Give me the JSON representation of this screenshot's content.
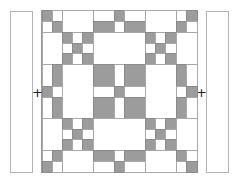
{
  "diagram": {
    "type": "quilt-layout",
    "colors": {
      "fabric_dark": "#9c9c9c",
      "fabric_light": "#ffffff",
      "seam": "#a8a8a8"
    },
    "joiners": [
      {
        "id": "left",
        "symbol": "+",
        "x": 32,
        "y": 86
      },
      {
        "id": "right",
        "symbol": "+",
        "x": 196,
        "y": 86
      }
    ],
    "side_borders": [
      {
        "id": "left-border",
        "x": 10,
        "y": 11,
        "w": 23,
        "h": 162
      },
      {
        "id": "right-border",
        "x": 206,
        "y": 11,
        "w": 23,
        "h": 162
      }
    ],
    "cells": [
      {
        "x": 42,
        "y": 10,
        "w": 10,
        "h": 11,
        "c": "grey"
      },
      {
        "x": 52,
        "y": 10,
        "w": 10,
        "h": 11,
        "c": "white"
      },
      {
        "x": 42,
        "y": 21,
        "w": 10,
        "h": 11,
        "c": "white"
      },
      {
        "x": 52,
        "y": 21,
        "w": 10,
        "h": 11,
        "c": "grey"
      },
      {
        "x": 62,
        "y": 10,
        "w": 31,
        "h": 22,
        "c": "white"
      },
      {
        "x": 93,
        "y": 10,
        "w": 21,
        "h": 11,
        "c": "white"
      },
      {
        "x": 114,
        "y": 10,
        "w": 10,
        "h": 11,
        "c": "grey"
      },
      {
        "x": 124,
        "y": 10,
        "w": 21,
        "h": 11,
        "c": "white"
      },
      {
        "x": 93,
        "y": 21,
        "w": 21,
        "h": 11,
        "c": "grey"
      },
      {
        "x": 114,
        "y": 21,
        "w": 10,
        "h": 11,
        "c": "white"
      },
      {
        "x": 124,
        "y": 21,
        "w": 21,
        "h": 11,
        "c": "grey"
      },
      {
        "x": 145,
        "y": 10,
        "w": 31,
        "h": 22,
        "c": "white"
      },
      {
        "x": 176,
        "y": 10,
        "w": 10,
        "h": 11,
        "c": "white"
      },
      {
        "x": 186,
        "y": 10,
        "w": 11,
        "h": 11,
        "c": "grey"
      },
      {
        "x": 176,
        "y": 21,
        "w": 10,
        "h": 11,
        "c": "grey"
      },
      {
        "x": 186,
        "y": 21,
        "w": 11,
        "h": 11,
        "c": "white"
      },
      {
        "x": 42,
        "y": 32,
        "w": 20,
        "h": 32,
        "c": "white"
      },
      {
        "x": 62,
        "y": 32,
        "w": 10,
        "h": 11,
        "c": "grey"
      },
      {
        "x": 72,
        "y": 32,
        "w": 10,
        "h": 11,
        "c": "white"
      },
      {
        "x": 82,
        "y": 32,
        "w": 11,
        "h": 11,
        "c": "grey"
      },
      {
        "x": 62,
        "y": 43,
        "w": 10,
        "h": 10,
        "c": "white"
      },
      {
        "x": 72,
        "y": 43,
        "w": 10,
        "h": 10,
        "c": "grey"
      },
      {
        "x": 82,
        "y": 43,
        "w": 11,
        "h": 10,
        "c": "white"
      },
      {
        "x": 62,
        "y": 53,
        "w": 10,
        "h": 11,
        "c": "grey"
      },
      {
        "x": 72,
        "y": 53,
        "w": 10,
        "h": 11,
        "c": "white"
      },
      {
        "x": 82,
        "y": 53,
        "w": 11,
        "h": 11,
        "c": "grey"
      },
      {
        "x": 93,
        "y": 32,
        "w": 52,
        "h": 32,
        "c": "white"
      },
      {
        "x": 145,
        "y": 32,
        "w": 10,
        "h": 11,
        "c": "grey"
      },
      {
        "x": 155,
        "y": 32,
        "w": 10,
        "h": 11,
        "c": "white"
      },
      {
        "x": 165,
        "y": 32,
        "w": 11,
        "h": 11,
        "c": "grey"
      },
      {
        "x": 145,
        "y": 43,
        "w": 10,
        "h": 10,
        "c": "white"
      },
      {
        "x": 155,
        "y": 43,
        "w": 10,
        "h": 10,
        "c": "grey"
      },
      {
        "x": 165,
        "y": 43,
        "w": 11,
        "h": 10,
        "c": "white"
      },
      {
        "x": 145,
        "y": 53,
        "w": 10,
        "h": 11,
        "c": "grey"
      },
      {
        "x": 155,
        "y": 53,
        "w": 10,
        "h": 11,
        "c": "white"
      },
      {
        "x": 165,
        "y": 53,
        "w": 11,
        "h": 11,
        "c": "grey"
      },
      {
        "x": 176,
        "y": 32,
        "w": 21,
        "h": 32,
        "c": "white"
      },
      {
        "x": 42,
        "y": 64,
        "w": 10,
        "h": 22,
        "c": "white"
      },
      {
        "x": 52,
        "y": 64,
        "w": 10,
        "h": 22,
        "c": "grey"
      },
      {
        "x": 42,
        "y": 86,
        "w": 10,
        "h": 11,
        "c": "grey"
      },
      {
        "x": 52,
        "y": 86,
        "w": 10,
        "h": 11,
        "c": "white"
      },
      {
        "x": 42,
        "y": 97,
        "w": 10,
        "h": 21,
        "c": "white"
      },
      {
        "x": 52,
        "y": 97,
        "w": 10,
        "h": 21,
        "c": "grey"
      },
      {
        "x": 62,
        "y": 64,
        "w": 31,
        "h": 54,
        "c": "white"
      },
      {
        "x": 93,
        "y": 64,
        "w": 21,
        "h": 22,
        "c": "grey"
      },
      {
        "x": 114,
        "y": 64,
        "w": 10,
        "h": 22,
        "c": "white"
      },
      {
        "x": 124,
        "y": 64,
        "w": 21,
        "h": 22,
        "c": "grey"
      },
      {
        "x": 93,
        "y": 86,
        "w": 21,
        "h": 11,
        "c": "white"
      },
      {
        "x": 114,
        "y": 86,
        "w": 10,
        "h": 11,
        "c": "grey"
      },
      {
        "x": 124,
        "y": 86,
        "w": 21,
        "h": 11,
        "c": "white"
      },
      {
        "x": 93,
        "y": 97,
        "w": 21,
        "h": 21,
        "c": "grey"
      },
      {
        "x": 114,
        "y": 97,
        "w": 10,
        "h": 21,
        "c": "white"
      },
      {
        "x": 124,
        "y": 97,
        "w": 21,
        "h": 21,
        "c": "grey"
      },
      {
        "x": 145,
        "y": 64,
        "w": 31,
        "h": 54,
        "c": "white"
      },
      {
        "x": 176,
        "y": 64,
        "w": 10,
        "h": 22,
        "c": "grey"
      },
      {
        "x": 186,
        "y": 64,
        "w": 11,
        "h": 22,
        "c": "white"
      },
      {
        "x": 176,
        "y": 86,
        "w": 10,
        "h": 11,
        "c": "white"
      },
      {
        "x": 186,
        "y": 86,
        "w": 11,
        "h": 11,
        "c": "grey"
      },
      {
        "x": 176,
        "y": 97,
        "w": 10,
        "h": 21,
        "c": "grey"
      },
      {
        "x": 186,
        "y": 97,
        "w": 11,
        "h": 21,
        "c": "white"
      },
      {
        "x": 42,
        "y": 118,
        "w": 20,
        "h": 32,
        "c": "white"
      },
      {
        "x": 62,
        "y": 118,
        "w": 10,
        "h": 11,
        "c": "grey"
      },
      {
        "x": 72,
        "y": 118,
        "w": 10,
        "h": 11,
        "c": "white"
      },
      {
        "x": 82,
        "y": 118,
        "w": 11,
        "h": 11,
        "c": "grey"
      },
      {
        "x": 62,
        "y": 129,
        "w": 10,
        "h": 10,
        "c": "white"
      },
      {
        "x": 72,
        "y": 129,
        "w": 10,
        "h": 10,
        "c": "grey"
      },
      {
        "x": 82,
        "y": 129,
        "w": 11,
        "h": 10,
        "c": "white"
      },
      {
        "x": 62,
        "y": 139,
        "w": 10,
        "h": 11,
        "c": "grey"
      },
      {
        "x": 72,
        "y": 139,
        "w": 10,
        "h": 11,
        "c": "white"
      },
      {
        "x": 82,
        "y": 139,
        "w": 11,
        "h": 11,
        "c": "grey"
      },
      {
        "x": 93,
        "y": 118,
        "w": 52,
        "h": 32,
        "c": "white"
      },
      {
        "x": 145,
        "y": 118,
        "w": 10,
        "h": 11,
        "c": "grey"
      },
      {
        "x": 155,
        "y": 118,
        "w": 10,
        "h": 11,
        "c": "white"
      },
      {
        "x": 165,
        "y": 118,
        "w": 11,
        "h": 11,
        "c": "grey"
      },
      {
        "x": 145,
        "y": 129,
        "w": 10,
        "h": 10,
        "c": "white"
      },
      {
        "x": 155,
        "y": 129,
        "w": 10,
        "h": 10,
        "c": "grey"
      },
      {
        "x": 165,
        "y": 129,
        "w": 11,
        "h": 10,
        "c": "white"
      },
      {
        "x": 145,
        "y": 139,
        "w": 10,
        "h": 11,
        "c": "grey"
      },
      {
        "x": 155,
        "y": 139,
        "w": 10,
        "h": 11,
        "c": "white"
      },
      {
        "x": 165,
        "y": 139,
        "w": 11,
        "h": 11,
        "c": "grey"
      },
      {
        "x": 176,
        "y": 118,
        "w": 21,
        "h": 32,
        "c": "white"
      },
      {
        "x": 42,
        "y": 150,
        "w": 10,
        "h": 11,
        "c": "white"
      },
      {
        "x": 52,
        "y": 150,
        "w": 10,
        "h": 11,
        "c": "grey"
      },
      {
        "x": 42,
        "y": 161,
        "w": 10,
        "h": 11,
        "c": "grey"
      },
      {
        "x": 52,
        "y": 161,
        "w": 10,
        "h": 11,
        "c": "white"
      },
      {
        "x": 62,
        "y": 150,
        "w": 31,
        "h": 22,
        "c": "white"
      },
      {
        "x": 93,
        "y": 150,
        "w": 21,
        "h": 11,
        "c": "grey"
      },
      {
        "x": 114,
        "y": 150,
        "w": 10,
        "h": 11,
        "c": "white"
      },
      {
        "x": 124,
        "y": 150,
        "w": 21,
        "h": 11,
        "c": "grey"
      },
      {
        "x": 93,
        "y": 161,
        "w": 21,
        "h": 11,
        "c": "white"
      },
      {
        "x": 114,
        "y": 161,
        "w": 10,
        "h": 11,
        "c": "grey"
      },
      {
        "x": 124,
        "y": 161,
        "w": 21,
        "h": 11,
        "c": "white"
      },
      {
        "x": 145,
        "y": 150,
        "w": 31,
        "h": 22,
        "c": "white"
      },
      {
        "x": 176,
        "y": 150,
        "w": 10,
        "h": 11,
        "c": "grey"
      },
      {
        "x": 186,
        "y": 150,
        "w": 11,
        "h": 11,
        "c": "white"
      },
      {
        "x": 176,
        "y": 161,
        "w": 10,
        "h": 11,
        "c": "white"
      },
      {
        "x": 186,
        "y": 161,
        "w": 11,
        "h": 11,
        "c": "grey"
      }
    ]
  }
}
